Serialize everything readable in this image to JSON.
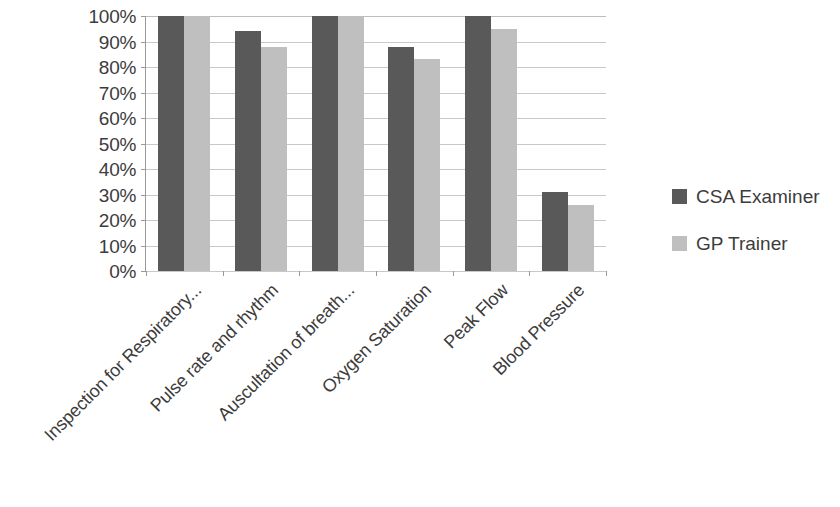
{
  "chart_data": {
    "type": "bar",
    "title": "",
    "xlabel": "",
    "ylabel": "",
    "ylim": [
      0,
      100
    ],
    "ytick_labels": [
      "100%",
      "90%",
      "80%",
      "70%",
      "60%",
      "50%",
      "40%",
      "30%",
      "20%",
      "10%",
      "0%"
    ],
    "ytick_values": [
      100,
      90,
      80,
      70,
      60,
      50,
      40,
      30,
      20,
      10,
      0
    ],
    "grid": true,
    "legend_position": "right",
    "categories": [
      "Inspection for Respiratory...",
      "Pulse rate and rhythm",
      "Auscultation of breath...",
      "Oxygen Saturation",
      "Peak Flow",
      "Blood Pressure"
    ],
    "series": [
      {
        "name": "CSA Examiner",
        "color": "#595959",
        "values": [
          100,
          94,
          100,
          88,
          100,
          31
        ]
      },
      {
        "name": "GP Trainer",
        "color": "#bfbfbf",
        "values": [
          100,
          88,
          100,
          83,
          95,
          26
        ]
      }
    ]
  },
  "legend": {
    "items": [
      {
        "label": "CSA Examiner",
        "color": "#595959"
      },
      {
        "label": "GP Trainer",
        "color": "#bfbfbf"
      }
    ]
  },
  "colors": {
    "series_dark": "#595959",
    "series_light": "#bfbfbf",
    "axis": "#9a9a9a",
    "gridline": "#c9c9c9",
    "text": "#3c3c3c",
    "background": "#ffffff"
  }
}
